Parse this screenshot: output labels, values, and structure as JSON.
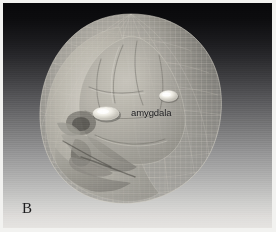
{
  "figure": {
    "panel_letter": "B",
    "type": "3d-volume-rendering",
    "annotations": [
      {
        "name": "amygdala-label",
        "text": "amygdala",
        "points_to": "bilateral amygdala ellipsoids"
      }
    ],
    "structures": [
      {
        "name": "scalp-head-surface",
        "appearance": "translucent wireframe mesh shell"
      },
      {
        "name": "skull-bone",
        "appearance": "semi-transparent grey bone"
      },
      {
        "name": "brain-surface",
        "appearance": "inner cortical surface with sulci"
      },
      {
        "name": "amygdala-left",
        "appearance": "bright ellipsoid"
      },
      {
        "name": "amygdala-right",
        "appearance": "bright ellipsoid"
      },
      {
        "name": "mandible-jaw",
        "appearance": "lower facial bone"
      },
      {
        "name": "orbit-eye-socket",
        "appearance": "dark recessed socket"
      },
      {
        "name": "nasal-cavity",
        "appearance": "dark recessed opening"
      }
    ],
    "colors": {
      "background_top": "#08080a",
      "background_bottom": "#e6e4e1",
      "border": "#f2f2f0",
      "label_text": "#141416",
      "amygdala_highlight": "#f3f1ea",
      "mesh_line": "#c8c6bd"
    },
    "background": {
      "style": "vertical gradient",
      "from": "#08080a",
      "to": "#e6e4e1"
    }
  }
}
